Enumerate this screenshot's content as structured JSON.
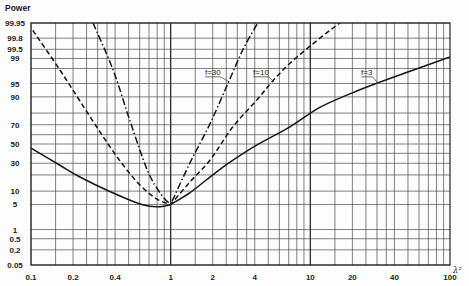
{
  "chart_data": {
    "type": "line",
    "title": "",
    "xlabel": "λ²",
    "ylabel": "Power",
    "x_scale": "log",
    "y_scale": "normal-probability",
    "xlim": [
      0.1,
      100
    ],
    "ylim": [
      0.05,
      99.95
    ],
    "grid": true,
    "legend_position": "inline labels with leader lines",
    "x_ticks": [
      0.1,
      0.2,
      0.4,
      1,
      2,
      4,
      10,
      20,
      40,
      100
    ],
    "x_tick_labels": [
      "0.1",
      "0.2",
      "0.4",
      "1",
      "2",
      "4",
      "10",
      "20",
      "40",
      "100"
    ],
    "y_ticks": [
      99.95,
      99.8,
      99.5,
      99,
      95,
      90,
      70,
      50,
      30,
      10,
      5,
      1,
      0.5,
      0.2,
      0.05
    ],
    "y_tick_labels": [
      "99.95",
      "99.8",
      "99.5",
      "99",
      "95",
      "90",
      "70",
      "50",
      "30",
      "10",
      "5",
      "1",
      "0.5",
      "0.2",
      "0.05"
    ],
    "x_gridline_multipliers": [
      1,
      1.5,
      2,
      2.5,
      3,
      3.5,
      4,
      5,
      6,
      7,
      8,
      9
    ],
    "x_major_gridlines": [
      1,
      10
    ],
    "y_gridlines": [
      99.95,
      99.8,
      99.5,
      99,
      98,
      95,
      90,
      80,
      70,
      60,
      50,
      40,
      30,
      20,
      10,
      5,
      1,
      0.5,
      0.2,
      0.05
    ],
    "series": [
      {
        "name": "f=3",
        "label": "f=3",
        "style": "solid",
        "x": [
          0.1,
          0.16,
          0.224,
          0.37,
          0.63,
          0.84,
          1,
          1.37,
          1.91,
          2.66,
          4.15,
          7.15,
          11.7,
          20,
          30,
          50,
          100
        ],
        "y": [
          45.6,
          28.4,
          18.5,
          9.7,
          4.9,
          4.4,
          5,
          9.2,
          18.4,
          31,
          49,
          68,
          84,
          91.8,
          95.1,
          97.5,
          99.1
        ],
        "label_anchor": {
          "x": 23.1,
          "y": 97.0
        },
        "label_pointer": {
          "x": 30,
          "y": 95.4
        }
      },
      {
        "name": "f=10",
        "label": "f=10",
        "style": "dashed",
        "x": [
          0.103,
          0.161,
          0.224,
          0.312,
          0.434,
          0.603,
          0.798,
          1,
          1.37,
          1.91,
          2.79,
          4.15,
          5.3,
          7.15,
          11.7,
          16.3
        ],
        "y": [
          99.9,
          97.8,
          87.9,
          62.8,
          32.2,
          13.2,
          6.7,
          5,
          15,
          33,
          68,
          88.5,
          95.4,
          98.6,
          99.8,
          99.95
        ],
        "label_anchor": {
          "x": 3.89,
          "y": 97.0
        },
        "label_pointer": {
          "x": 5.5,
          "y": 95.4
        }
      },
      {
        "name": "f=30",
        "label": "f=30",
        "style": "dashdot",
        "x": [
          0.278,
          0.387,
          0.51,
          0.68,
          0.85,
          1,
          1.37,
          1.91,
          2.57,
          3.3,
          4.2
        ],
        "y": [
          99.95,
          97.8,
          74,
          24,
          8.7,
          5,
          30,
          70.7,
          95,
          99.5,
          99.95
        ],
        "label_anchor": {
          "x": 1.76,
          "y": 97.0
        },
        "label_pointer": {
          "x": 2.62,
          "y": 95.4
        }
      }
    ]
  }
}
